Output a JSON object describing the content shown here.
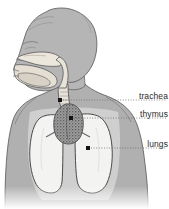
{
  "figure": {
    "background_color": "#ffffff",
    "width": 169,
    "height": 209
  },
  "palette": {
    "body_fill": "#b0b0b0",
    "body_fill_dark": "#9a9a9a",
    "head_fill": "#b5b5b5",
    "airway_fill": "#ece7dd",
    "airway_fill_shadow": "#dcd6cb",
    "chest_cavity_fill": "#cccccc",
    "lung_fill": "#f2f2f0",
    "thymus_fill": "#8a8a8a",
    "outline": "#555555",
    "outline_dark": "#3a3a3a",
    "leader_line": "#6d6d6d",
    "marker_dot": "#141414",
    "label_text": "#2b2b2b"
  },
  "labels": [
    {
      "id": "trachea",
      "text": "trachea",
      "marker": {
        "x": 60,
        "y": 100
      },
      "leader": {
        "x1": 63,
        "y1": 100,
        "x2": 166,
        "y2": 100
      }
    },
    {
      "id": "thymus",
      "text": "thymus",
      "marker": {
        "x": 71,
        "y": 118
      },
      "leader": {
        "x1": 74,
        "y1": 118,
        "x2": 166,
        "y2": 118
      }
    },
    {
      "id": "lungs",
      "text": "lungs",
      "marker": {
        "x": 88,
        "y": 148
      },
      "leader": {
        "x1": 91,
        "y1": 148,
        "x2": 166,
        "y2": 148
      }
    }
  ],
  "anatomy_parts": [
    {
      "id": "head",
      "name": "head-profile"
    },
    {
      "id": "nasal-cavity",
      "name": "nasal-cavity"
    },
    {
      "id": "oral-cavity",
      "name": "oral-cavity"
    },
    {
      "id": "tongue",
      "name": "tongue"
    },
    {
      "id": "pharynx",
      "name": "pharynx"
    },
    {
      "id": "trachea",
      "name": "trachea-tube"
    },
    {
      "id": "torso",
      "name": "torso-silhouette"
    },
    {
      "id": "chest-cavity",
      "name": "chest-cavity"
    },
    {
      "id": "lung-left",
      "name": "lung-left"
    },
    {
      "id": "lung-right",
      "name": "lung-right"
    },
    {
      "id": "thymus",
      "name": "thymus-gland"
    },
    {
      "id": "bronchi",
      "name": "bronchi"
    }
  ]
}
